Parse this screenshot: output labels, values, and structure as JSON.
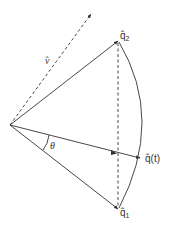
{
  "diagram": {
    "title": "",
    "colors": {
      "stroke": "#333333",
      "background": "#ffffff"
    },
    "origin": {
      "x": 10,
      "y": 125
    },
    "vectors": [
      {
        "id": "q2",
        "label": "q̂",
        "subscript": "2",
        "tip": {
          "x": 118,
          "y": 41
        }
      },
      {
        "id": "qt",
        "label": "q̂(t)",
        "tip": {
          "x": 141,
          "y": 158
        }
      },
      {
        "id": "q1",
        "label": "q̂",
        "subscript": "1",
        "tip": {
          "x": 118,
          "y": 209
        }
      },
      {
        "id": "v",
        "label": "v̂",
        "style": "dashed",
        "tip": {
          "x": 92,
          "y": 13
        }
      }
    ],
    "angle_label": "θ",
    "arc": "circular arc from q̂2 to q̂1",
    "chord": "dashed vertical line from q̂2 to q̂1"
  },
  "labels": {
    "q2": "q̂",
    "q2_sub": "2",
    "qt": "q̂(t)",
    "q1": "q̂",
    "q1_sub": "1",
    "v": "v̂",
    "theta": "θ"
  }
}
